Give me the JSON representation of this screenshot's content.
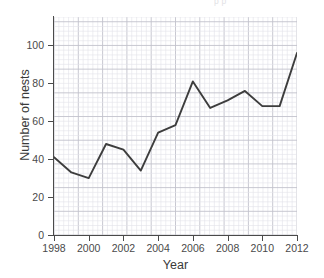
{
  "top_caption": "p p",
  "chart_data": {
    "type": "line",
    "title": "",
    "xlabel": "Year",
    "ylabel": "Number of nests",
    "x": [
      1998,
      1999,
      2000,
      2001,
      2002,
      2003,
      2004,
      2005,
      2006,
      2007,
      2008,
      2009,
      2010,
      2011,
      2012
    ],
    "values": [
      41,
      33,
      30,
      48,
      45,
      34,
      54,
      58,
      81,
      67,
      71,
      76,
      68,
      68,
      96
    ],
    "series": [
      {
        "name": "Number of nests",
        "values": [
          41,
          33,
          30,
          48,
          45,
          34,
          54,
          58,
          81,
          67,
          71,
          76,
          68,
          68,
          96
        ]
      }
    ],
    "xlim": [
      1998,
      2012
    ],
    "ylim": [
      0,
      115
    ],
    "xticks": [
      1998,
      2000,
      2002,
      2004,
      2006,
      2008,
      2010,
      2012
    ],
    "xtick_labels": [
      "1998",
      "2000",
      "2002",
      "2004",
      "2006",
      "2008",
      "2010",
      "2012"
    ],
    "yticks": [
      0,
      20,
      40,
      60,
      80,
      100
    ],
    "ytick_labels": [
      "0",
      "20",
      "40",
      "60",
      "80",
      "100"
    ],
    "grid": true,
    "grid_style": "graph-paper minor grid with major lines every 5 cells",
    "legend": false,
    "legend_position": "none",
    "line_color": "#3d3d3d",
    "minor_grid_color": "#e3e3ea",
    "major_grid_color": "#c2c2cc",
    "axis_color": "#4a4a4a",
    "background_color": "#ffffff"
  }
}
